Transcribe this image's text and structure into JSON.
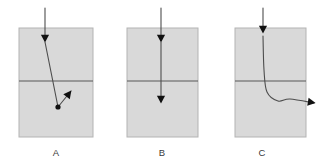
{
  "figure": {
    "type": "diagram",
    "background_color": "#ffffff",
    "panel_count": 3,
    "panel_fill_color": "#d9d9d9",
    "panel_border_color": "#b3b3b3",
    "interface_line_color": "#595959",
    "ray_color": "#4d4d4d",
    "arrowhead_color": "#111111",
    "label_color": "#3a3a3a",
    "panels": [
      {
        "id": "A",
        "label": "A",
        "label_x": 56,
        "label_y": 153,
        "box": {
          "x": 19,
          "y": 28,
          "width": 74,
          "height": 109
        },
        "interface_y": 81,
        "behavior": "ray enters from above, travels down-right through the interface, scatters at a vertex below the interface, then deflects up-right and ends with an arrowhead inside the lower region",
        "incoming_segment": {
          "x1": 45,
          "y1": 8,
          "x2": 45,
          "y2": 40
        },
        "incoming_arrow": {
          "x": 45,
          "y": 42,
          "direction": "down"
        },
        "path_points": [
          {
            "x": 45,
            "y": 42
          },
          {
            "x": 58,
            "y": 107
          },
          {
            "x": 71,
            "y": 91
          }
        ],
        "vertex_marker": {
          "x": 58,
          "y": 107
        },
        "exit_arrow": {
          "x": 71,
          "y": 91,
          "direction": "up-right",
          "angle_deg": -52
        }
      },
      {
        "id": "B",
        "label": "B",
        "label_x": 162,
        "label_y": 153,
        "box": {
          "x": 127,
          "y": 28,
          "width": 71,
          "height": 109
        },
        "interface_y": 81,
        "behavior": "ray enters from above and travels straight down, passing through the interface undeflected, ending with an arrowhead in the lower region",
        "incoming_segment": {
          "x1": 161,
          "y1": 8,
          "x2": 161,
          "y2": 40
        },
        "incoming_arrow": {
          "x": 161,
          "y": 42,
          "direction": "down"
        },
        "path_points": [
          {
            "x": 161,
            "y": 42
          },
          {
            "x": 161,
            "y": 101
          }
        ],
        "exit_arrow": {
          "x": 161,
          "y": 103,
          "direction": "down",
          "angle_deg": 90
        }
      },
      {
        "id": "C",
        "label": "C",
        "label_x": 262,
        "label_y": 153,
        "box": {
          "x": 235,
          "y": 28,
          "width": 71,
          "height": 109
        },
        "interface_y": 81,
        "behavior": "ray enters from above, curves smoothly after crossing the interface, bends through ninety degrees and exits the box horizontally to the right, ending with an arrowhead outside the box",
        "incoming_segment": {
          "x1": 263,
          "y1": 8,
          "x2": 263,
          "y2": 30
        },
        "incoming_arrow": {
          "x": 263,
          "y": 33,
          "direction": "down"
        },
        "path_points": [
          {
            "x": 263,
            "y": 36
          },
          {
            "x": 264,
            "y": 70
          },
          {
            "x": 267,
            "y": 92
          },
          {
            "x": 278,
            "y": 101
          },
          {
            "x": 290,
            "y": 99
          },
          {
            "x": 314,
            "y": 103
          }
        ],
        "exit_arrow": {
          "x": 315,
          "y": 103,
          "direction": "right",
          "angle_deg": 10
        }
      }
    ]
  }
}
